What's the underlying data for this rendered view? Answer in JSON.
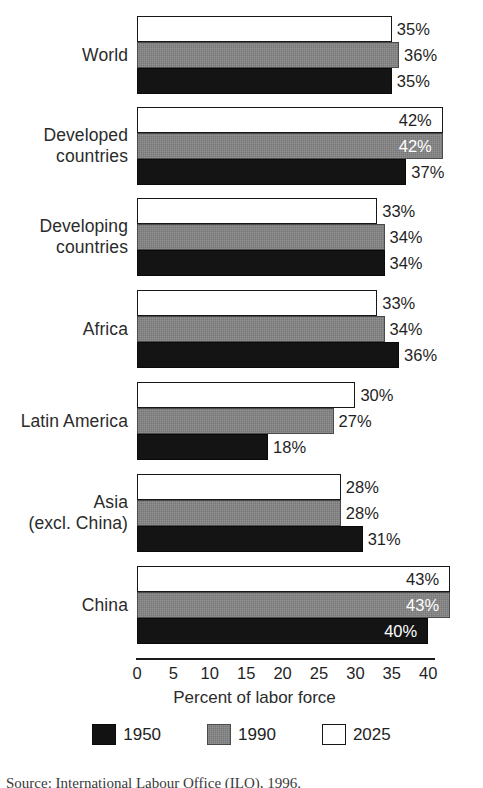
{
  "chart_data": {
    "type": "bar",
    "orientation": "horizontal",
    "title": "",
    "xlabel": "Percent of labor force",
    "ylabel": "",
    "xlim": [
      0,
      45
    ],
    "xticks": [
      0,
      5,
      10,
      15,
      20,
      25,
      30,
      35,
      40
    ],
    "grid": false,
    "legend_position": "bottom",
    "categories": [
      "World",
      "Developed\ncountries",
      "Developing\ncountries",
      "Africa",
      "Latin America",
      "Asia\n(excl. China)",
      "China"
    ],
    "series": [
      {
        "name": "1950",
        "color": "#141414",
        "values": [
          35,
          37,
          34,
          36,
          18,
          31,
          40
        ]
      },
      {
        "name": "1990",
        "color": "#777777",
        "values": [
          36,
          42,
          34,
          34,
          27,
          28,
          43
        ]
      },
      {
        "name": "2025",
        "color": "#ffffff",
        "values": [
          35,
          42,
          33,
          33,
          30,
          28,
          43
        ]
      }
    ],
    "value_labels": {
      "World": {
        "2025": "35%",
        "1990": "36%",
        "1950": "35%"
      },
      "Developed countries": {
        "2025": "42%",
        "1990": "42%",
        "1950": "37%"
      },
      "Developing countries": {
        "2025": "33%",
        "1990": "34%",
        "1950": "34%"
      },
      "Africa": {
        "2025": "33%",
        "1990": "34%",
        "1950": "36%"
      },
      "Latin America": {
        "2025": "30%",
        "1990": "27%",
        "1950": "18%"
      },
      "Asia (excl. China)": {
        "2025": "28%",
        "1990": "28%",
        "1950": "31%"
      },
      "China": {
        "2025": "43%",
        "1990": "43%",
        "1950": "40%"
      }
    }
  },
  "axis": {
    "ticks": [
      "0",
      "5",
      "10",
      "15",
      "20",
      "25",
      "30",
      "35",
      "40"
    ],
    "title": "Percent of labor force"
  },
  "legend": {
    "items": [
      {
        "label": "1950",
        "swatch": "black-swatch"
      },
      {
        "label": "1990",
        "swatch": "gray-swatch"
      },
      {
        "label": "2025",
        "swatch": "white-swatch"
      }
    ]
  },
  "rows": [
    {
      "label": "World",
      "bars": [
        {
          "series": "2025",
          "value": 35,
          "label": "35%",
          "label_placement": "outside"
        },
        {
          "series": "1990",
          "value": 36,
          "label": "36%",
          "label_placement": "outside"
        },
        {
          "series": "1950",
          "value": 35,
          "label": "35%",
          "label_placement": "outside"
        }
      ]
    },
    {
      "label": "Developed\ncountries",
      "bars": [
        {
          "series": "2025",
          "value": 42,
          "label": "42%",
          "label_placement": "inside-dark"
        },
        {
          "series": "1990",
          "value": 42,
          "label": "42%",
          "label_placement": "inside-light"
        },
        {
          "series": "1950",
          "value": 37,
          "label": "37%",
          "label_placement": "outside"
        }
      ]
    },
    {
      "label": "Developing\ncountries",
      "bars": [
        {
          "series": "2025",
          "value": 33,
          "label": "33%",
          "label_placement": "outside"
        },
        {
          "series": "1990",
          "value": 34,
          "label": "34%",
          "label_placement": "outside"
        },
        {
          "series": "1950",
          "value": 34,
          "label": "34%",
          "label_placement": "outside"
        }
      ]
    },
    {
      "label": "Africa",
      "bars": [
        {
          "series": "2025",
          "value": 33,
          "label": "33%",
          "label_placement": "outside"
        },
        {
          "series": "1990",
          "value": 34,
          "label": "34%",
          "label_placement": "outside"
        },
        {
          "series": "1950",
          "value": 36,
          "label": "36%",
          "label_placement": "outside"
        }
      ]
    },
    {
      "label": "Latin America",
      "bars": [
        {
          "series": "2025",
          "value": 30,
          "label": "30%",
          "label_placement": "outside"
        },
        {
          "series": "1990",
          "value": 27,
          "label": "27%",
          "label_placement": "outside"
        },
        {
          "series": "1950",
          "value": 18,
          "label": "18%",
          "label_placement": "outside"
        }
      ]
    },
    {
      "label": "Asia\n(excl. China)",
      "bars": [
        {
          "series": "2025",
          "value": 28,
          "label": "28%",
          "label_placement": "outside"
        },
        {
          "series": "1990",
          "value": 28,
          "label": "28%",
          "label_placement": "outside"
        },
        {
          "series": "1950",
          "value": 31,
          "label": "31%",
          "label_placement": "outside"
        }
      ]
    },
    {
      "label": "China",
      "bars": [
        {
          "series": "2025",
          "value": 43,
          "label": "43%",
          "label_placement": "inside-dark"
        },
        {
          "series": "1990",
          "value": 43,
          "label": "43%",
          "label_placement": "inside-light"
        },
        {
          "series": "1950",
          "value": 40,
          "label": "40%",
          "label_placement": "inside-light"
        }
      ]
    }
  ],
  "source_note": "Source: International Labour Office (ILO), 1996.",
  "colors": {
    "series_1950": "#141414",
    "series_1990": "#777777",
    "series_2025": "#ffffff",
    "text": "#1f1f1f",
    "background": "#ffffff"
  }
}
